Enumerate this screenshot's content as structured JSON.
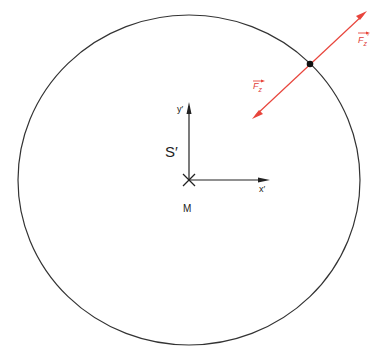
{
  "diagram": {
    "frame_label": "S′",
    "origin_label": "M",
    "x_axis_label": "x′",
    "y_axis_label": "y′",
    "force_label_lower": "F",
    "force_label_lower_sub": "z",
    "force_label_upper": "F",
    "force_label_upper_sub": "z",
    "force_label_upper_prime": "′",
    "colors": {
      "circle": "#333333",
      "axes": "#222222",
      "force": "#e8453c",
      "point": "#111111"
    }
  }
}
